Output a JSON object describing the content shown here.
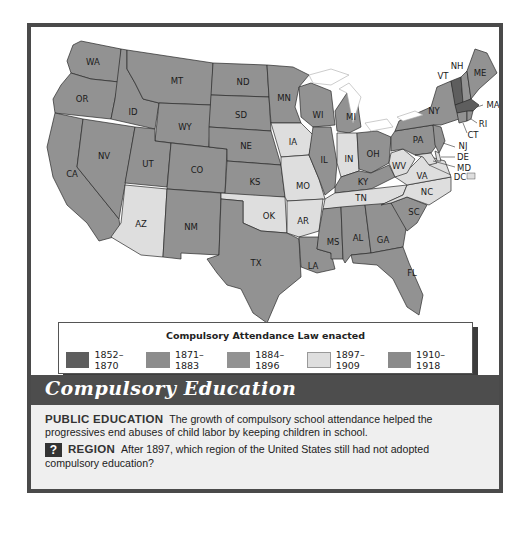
{
  "map": {
    "title": "Compulsory Education",
    "legend": {
      "title": "Compulsory Attendance Law enacted",
      "items": [
        {
          "label": "1852–1870",
          "color": "#5e5e5e"
        },
        {
          "label": "1871–1883",
          "color": "#8c8c8c"
        },
        {
          "label": "1884–1896",
          "color": "#929292"
        },
        {
          "label": "1897–1909",
          "color": "#dedede"
        },
        {
          "label": "1910–1918",
          "color": "#8a8a8a"
        }
      ]
    },
    "states": {
      "WA": "WA",
      "OR": "OR",
      "CA": "CA",
      "ID": "ID",
      "NV": "NV",
      "MT": "MT",
      "WY": "WY",
      "UT": "UT",
      "AZ": "AZ",
      "CO": "CO",
      "NM": "NM",
      "ND": "ND",
      "SD": "SD",
      "NE": "NE",
      "KS": "KS",
      "OK": "OK",
      "TX": "TX",
      "MN": "MN",
      "IA": "IA",
      "MO": "MO",
      "AR": "AR",
      "LA": "LA",
      "WI": "WI",
      "IL": "IL",
      "MI": "MI",
      "IN": "IN",
      "OH": "OH",
      "KY": "KY",
      "TN": "TN",
      "MS": "MS",
      "AL": "AL",
      "GA": "GA",
      "FL": "FL",
      "SC": "SC",
      "NC": "NC",
      "VA": "VA",
      "WV": "WV",
      "PA": "PA",
      "NY": "NY",
      "VT": "VT",
      "NH": "NH",
      "ME": "ME",
      "MA": "MA",
      "RI": "RI",
      "CT": "CT",
      "NJ": "NJ",
      "DE": "DE",
      "MD": "MD",
      "DC": "DC"
    }
  },
  "caption": {
    "heading1": "PUBLIC EDUCATION",
    "text1": "The growth of compulsory school attendance helped the progressives end abuses of child labor by keeping children in school.",
    "icon": "?",
    "heading2": "REGION",
    "text2": "After 1897, which region of the United States still had not adopted compulsory education?"
  }
}
